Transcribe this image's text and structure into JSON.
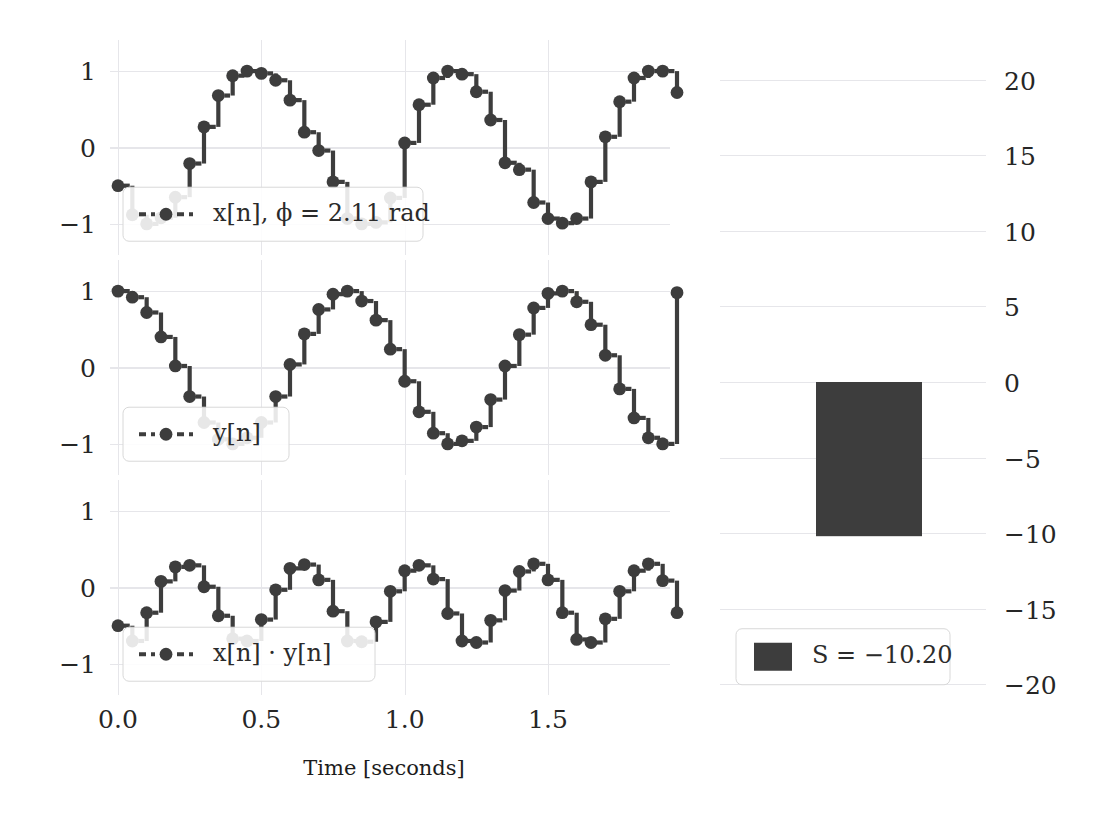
{
  "figure": {
    "background": "#ffffff",
    "series_color": "#3d3d3d",
    "grid_color": "#e6e6ea"
  },
  "axes": {
    "x": {
      "label": "Time [seconds]",
      "ticks": [
        "0.0",
        "0.5",
        "1.0",
        "1.5"
      ],
      "tick_values": [
        0.0,
        0.5,
        1.0,
        1.5
      ],
      "range": [
        -0.05,
        1.98
      ]
    },
    "y_signal": {
      "ticks": [
        "1",
        "0",
        "−1"
      ],
      "tick_values": [
        1,
        0,
        -1
      ],
      "range": [
        -1.25,
        1.25
      ]
    },
    "y_bar": {
      "ticks": [
        "20",
        "15",
        "10",
        "5",
        "0",
        "−5",
        "−10",
        "−15",
        "−20"
      ],
      "tick_values": [
        20,
        15,
        10,
        5,
        0,
        -5,
        -10,
        -15,
        -20
      ],
      "range": [
        -21.5,
        21.5
      ]
    }
  },
  "legends": {
    "panel1": "x[n],  ϕ = 2.11 rad",
    "panel2": "y[n]",
    "panel3": "x[n] · y[n]",
    "bar": "S = −10.20"
  },
  "chart_data": {
    "type": "line",
    "title": "",
    "xlabel": "Time [seconds]",
    "ylabel": "",
    "grid": true,
    "legend_position": "lower-left",
    "sample_rate_hz": 20,
    "phase_rad": 2.11,
    "frequency_hz": 1.5,
    "panels": [
      {
        "name": "x[n]",
        "label": "x[n],  ϕ = 2.11 rad",
        "ylim": [
          -1.25,
          1.25
        ],
        "yticks": [
          1,
          0,
          -1
        ],
        "marker": "o",
        "linestyle": "dashed-step",
        "x": [
          0.0,
          0.05,
          0.1,
          0.15,
          0.2,
          0.25,
          0.3,
          0.35,
          0.4,
          0.45,
          0.5,
          0.55,
          0.6,
          0.65,
          0.7,
          0.75,
          0.8,
          0.85,
          0.9,
          0.95,
          1.0,
          1.05,
          1.1,
          1.15,
          1.2,
          1.25,
          1.3,
          1.35,
          1.4,
          1.45,
          1.5,
          1.55,
          1.6,
          1.65,
          1.7,
          1.75,
          1.8,
          1.85,
          1.9,
          1.95
        ],
        "y": [
          -0.5,
          -0.88,
          -1.0,
          -0.92,
          -0.65,
          -0.21,
          0.27,
          0.68,
          0.94,
          1.0,
          0.97,
          0.88,
          0.62,
          0.2,
          -0.04,
          -0.45,
          -0.93,
          -1.0,
          -0.98,
          -0.66,
          0.06,
          0.56,
          0.91,
          1.0,
          0.96,
          0.73,
          0.36,
          -0.2,
          -0.29,
          -0.72,
          -0.93,
          -0.99,
          -0.93,
          -0.45,
          0.14,
          0.6,
          0.91,
          1.0,
          1.0,
          0.72
        ]
      },
      {
        "name": "y[n]",
        "label": "y[n]",
        "ylim": [
          -1.25,
          1.25
        ],
        "yticks": [
          1,
          0,
          -1
        ],
        "marker": "o",
        "linestyle": "dashed-step",
        "x": [
          0.0,
          0.05,
          0.1,
          0.15,
          0.2,
          0.25,
          0.3,
          0.35,
          0.4,
          0.45,
          0.5,
          0.55,
          0.6,
          0.65,
          0.7,
          0.75,
          0.8,
          0.85,
          0.9,
          0.95,
          1.0,
          1.05,
          1.1,
          1.15,
          1.2,
          1.25,
          1.3,
          1.35,
          1.4,
          1.45,
          1.5,
          1.55,
          1.6,
          1.65,
          1.7,
          1.75,
          1.8,
          1.85,
          1.9,
          1.95
        ],
        "y": [
          1.0,
          0.92,
          0.72,
          0.4,
          0.02,
          -0.38,
          -0.72,
          -0.94,
          -1.0,
          -0.92,
          -0.72,
          -0.38,
          0.04,
          0.44,
          0.76,
          0.96,
          1.0,
          0.87,
          0.62,
          0.24,
          -0.18,
          -0.58,
          -0.86,
          -1.0,
          -0.96,
          -0.78,
          -0.42,
          0.02,
          0.43,
          0.78,
          0.97,
          1.0,
          0.86,
          0.56,
          0.16,
          -0.28,
          -0.66,
          -0.92,
          -1.0,
          0.98
        ]
      },
      {
        "name": "x[n]·y[n]",
        "label": "x[n] · y[n]",
        "ylim": [
          -1.25,
          1.25
        ],
        "yticks": [
          1,
          0,
          -1
        ],
        "marker": "o",
        "linestyle": "dashed-step",
        "x": [
          0.0,
          0.05,
          0.1,
          0.15,
          0.2,
          0.25,
          0.3,
          0.35,
          0.4,
          0.45,
          0.5,
          0.55,
          0.6,
          0.65,
          0.7,
          0.75,
          0.8,
          0.85,
          0.9,
          0.95,
          1.0,
          1.05,
          1.1,
          1.15,
          1.2,
          1.25,
          1.3,
          1.35,
          1.4,
          1.45,
          1.5,
          1.55,
          1.6,
          1.65,
          1.7,
          1.75,
          1.8,
          1.85,
          1.9,
          1.95
        ],
        "y": [
          -0.5,
          -0.7,
          -0.33,
          0.08,
          0.27,
          0.29,
          0.01,
          -0.37,
          -0.67,
          -0.7,
          -0.42,
          -0.03,
          0.25,
          0.3,
          0.1,
          -0.31,
          -0.7,
          -0.71,
          -0.45,
          -0.05,
          0.22,
          0.29,
          0.11,
          -0.34,
          -0.7,
          -0.72,
          -0.43,
          -0.04,
          0.21,
          0.31,
          0.1,
          -0.33,
          -0.68,
          -0.72,
          -0.41,
          -0.05,
          0.22,
          0.31,
          0.09,
          -0.33
        ]
      }
    ],
    "bar_panel": {
      "type": "bar",
      "label": "S = −10.20",
      "value": -10.2,
      "ylim": [
        -21.5,
        21.5
      ],
      "yticks": [
        20,
        15,
        10,
        5,
        0,
        -5,
        -10,
        -15,
        -20
      ],
      "color": "#3d3d3d"
    }
  }
}
